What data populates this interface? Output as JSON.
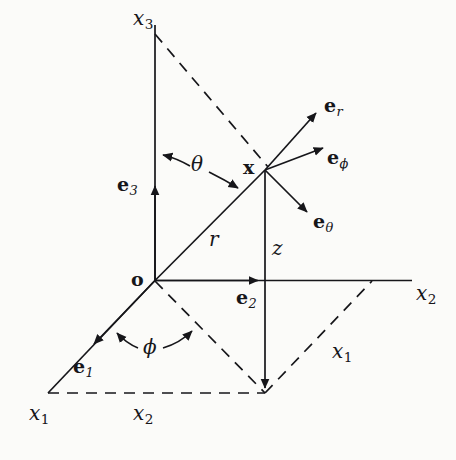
{
  "figure": {
    "type": "coordinate-system-diagram",
    "background_color": "#fbfbf9",
    "stroke_color": "#16161a",
    "labels": {
      "axis_x3_top": {
        "base": "x",
        "sub": "3"
      },
      "axis_x2_right": {
        "base": "x",
        "sub": "2"
      },
      "axis_x1_left": {
        "base": "x",
        "sub": "1"
      },
      "proj_x1_right": {
        "base": "x",
        "sub": "1"
      },
      "proj_x2_bottom": {
        "base": "x",
        "sub": "2"
      },
      "origin": {
        "base": "o"
      },
      "point_x": {
        "base": "x"
      },
      "basis_e1": {
        "base": "e",
        "sub": "1"
      },
      "basis_e2": {
        "base": "e",
        "sub": "2"
      },
      "basis_e3": {
        "base": "e",
        "sub": "3"
      },
      "basis_er": {
        "base": "e",
        "sub": "r"
      },
      "basis_ephi": {
        "base": "e",
        "sub": "ϕ"
      },
      "basis_etheta": {
        "base": "e",
        "sub": "θ"
      },
      "radius_r": {
        "base": "r"
      },
      "height_z": {
        "base": "z"
      },
      "angle_theta": {
        "base": "θ"
      },
      "angle_phi": {
        "base": "ϕ"
      }
    }
  }
}
